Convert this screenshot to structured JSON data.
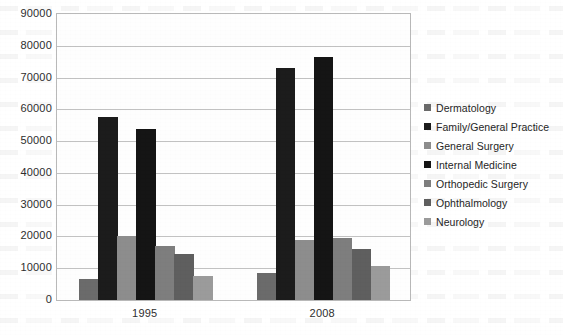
{
  "chart_data": {
    "type": "bar",
    "title": "",
    "subtitle": "",
    "xlabel": "",
    "ylabel": "",
    "categories": [
      "1995",
      "2008"
    ],
    "ylim": [
      0,
      90000
    ],
    "ytick_step": 10000,
    "yticks": [
      "90000",
      "80000",
      "70000",
      "60000",
      "50000",
      "40000",
      "30000",
      "20000",
      "10000",
      "0"
    ],
    "grid": true,
    "legend_position": "right",
    "series": [
      {
        "name": "Dermatology",
        "color": "#6b6b6b",
        "values": [
          6500,
          8600
        ]
      },
      {
        "name": "Family/General Practice",
        "color": "#1c1c1c",
        "values": [
          57500,
          73000
        ]
      },
      {
        "name": "General Surgery",
        "color": "#8d8d8d",
        "values": [
          20000,
          19000
        ]
      },
      {
        "name": "Internal Medicine",
        "color": "#151515",
        "values": [
          53800,
          76500
        ]
      },
      {
        "name": "Orthopedic Surgery",
        "color": "#7e7e7e",
        "values": [
          17000,
          19400
        ]
      },
      {
        "name": "Ophthalmology",
        "color": "#5f5f5f",
        "values": [
          14500,
          16000
        ]
      },
      {
        "name": "Neurology",
        "color": "#9b9b9b",
        "values": [
          7500,
          10600
        ]
      }
    ]
  },
  "legend": {
    "items": [
      {
        "label": "Dermatology"
      },
      {
        "label": "Family/General Practice"
      },
      {
        "label": "General Surgery"
      },
      {
        "label": "Internal Medicine"
      },
      {
        "label": "Orthopedic Surgery"
      },
      {
        "label": "Ophthalmology"
      },
      {
        "label": "Neurology"
      }
    ]
  },
  "colors": {
    "plot_border": "#b9b9b9",
    "gridline": "#c2c2c2",
    "background": "#ffffff",
    "text": "#2e2e2e"
  }
}
